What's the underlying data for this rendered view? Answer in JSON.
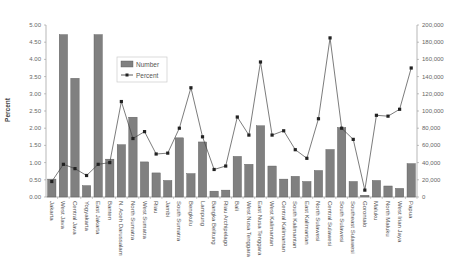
{
  "chart_data": {
    "type": "bar",
    "title": "",
    "xlabel": "",
    "ylabel": "Percent",
    "y2label": "",
    "ylim": [
      0,
      5.0
    ],
    "y2lim": [
      0,
      200000
    ],
    "yticks": [
      "0.00",
      "0.50",
      "1.00",
      "1.50",
      "2.00",
      "2.50",
      "3.00",
      "3.50",
      "4.00",
      "4.50",
      "5.00"
    ],
    "y2ticks": [
      "0",
      "20,000",
      "40,000",
      "60,000",
      "80,000",
      "100,000",
      "120,000",
      "140,000",
      "160,000",
      "180,000",
      "200,000"
    ],
    "grid": false,
    "legend_position": "upper-left-inside",
    "categories": [
      "Jakarta",
      "West Java",
      "Central Java",
      "Yogyakarta",
      "East Jakarta",
      "Banten",
      "N. Aceh Darussalam",
      "North Sumatra",
      "West Sumatra",
      "Riau",
      "Jambi",
      "South Sumatra",
      "Bengkulu",
      "Lampung",
      "Bangka Belitung",
      "Riau Archipelago",
      "Bali",
      "West Nusa Tenggara",
      "East Nusa Tenggara",
      "West Kalimantan",
      "Central Kalimantan",
      "South Kalimantan",
      "East Kalimantan",
      "North Sulawesi",
      "Central Sulawesi",
      "South Sulawesi",
      "Southeast Sulawesi",
      "Gorontalo",
      "Maluku",
      "North Maluku",
      "West Irian Jaya",
      "Papua"
    ],
    "series": [
      {
        "name": "Number",
        "type": "bar",
        "axis": "left",
        "color": "#808080",
        "values": [
          0.52,
          4.72,
          3.45,
          0.33,
          4.72,
          1.1,
          1.52,
          2.32,
          1.02,
          0.7,
          0.48,
          1.72,
          0.68,
          1.6,
          0.17,
          0.2,
          1.18,
          0.95,
          2.07,
          0.9,
          0.52,
          0.6,
          0.45,
          0.77,
          1.38,
          2.02,
          0.45,
          0.05,
          0.48,
          0.32,
          0.25,
          0.97
        ]
      },
      {
        "name": "Percent",
        "type": "line",
        "axis": "right",
        "color": "#333333",
        "marker": "square",
        "values": [
          18000,
          38000,
          33000,
          25000,
          38000,
          40000,
          111000,
          68000,
          76000,
          50000,
          51000,
          80000,
          127000,
          70000,
          32000,
          36000,
          93000,
          72000,
          157000,
          72000,
          77000,
          55000,
          45000,
          91000,
          185000,
          80000,
          67000,
          8000,
          95000,
          94000,
          102000,
          150000
        ]
      }
    ]
  },
  "legend": {
    "items": [
      {
        "label": "Number",
        "swatch": "bar"
      },
      {
        "label": "Percent",
        "swatch": "line-marker"
      }
    ]
  }
}
